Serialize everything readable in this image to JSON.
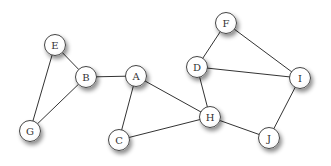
{
  "graph": {
    "nodes": [
      {
        "id": "E",
        "label": "E",
        "x": 55,
        "y": 45
      },
      {
        "id": "B",
        "label": "B",
        "x": 86,
        "y": 77
      },
      {
        "id": "A",
        "label": "A",
        "x": 136,
        "y": 76
      },
      {
        "id": "G",
        "label": "G",
        "x": 30,
        "y": 131
      },
      {
        "id": "C",
        "label": "C",
        "x": 119,
        "y": 140
      },
      {
        "id": "F",
        "label": "F",
        "x": 226,
        "y": 23
      },
      {
        "id": "D",
        "label": "D",
        "x": 197,
        "y": 67
      },
      {
        "id": "I",
        "label": "I",
        "x": 300,
        "y": 78
      },
      {
        "id": "H",
        "label": "H",
        "x": 210,
        "y": 117
      },
      {
        "id": "J",
        "label": "J",
        "x": 269,
        "y": 138
      }
    ],
    "edges": [
      [
        "E",
        "B"
      ],
      [
        "E",
        "G"
      ],
      [
        "B",
        "G"
      ],
      [
        "B",
        "A"
      ],
      [
        "A",
        "C"
      ],
      [
        "A",
        "H"
      ],
      [
        "C",
        "H"
      ],
      [
        "D",
        "F"
      ],
      [
        "F",
        "I"
      ],
      [
        "D",
        "I"
      ],
      [
        "D",
        "H"
      ],
      [
        "H",
        "J"
      ],
      [
        "J",
        "I"
      ]
    ],
    "colors": {
      "edge": "#333333",
      "node_border": "#444444",
      "label": "#333333"
    }
  }
}
